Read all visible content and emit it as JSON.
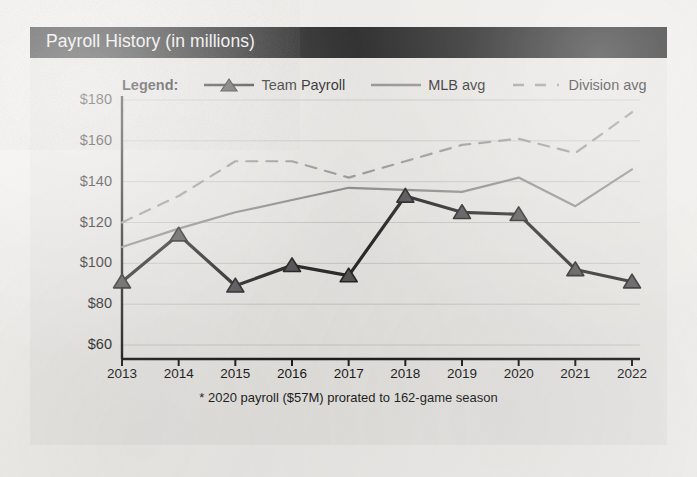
{
  "card": {
    "title": "Payroll History (in millions)",
    "title_bar_color": "#1b1b1b",
    "background_color": "#e7e5e2"
  },
  "legend": {
    "label": "Legend:",
    "entries": [
      {
        "name": "Team Payroll",
        "marker": "triangle-marker-icon",
        "style": "solid-thick",
        "color": "#2b2b2b"
      },
      {
        "name": "MLB avg",
        "marker": "line-swatch-icon",
        "style": "solid-thin",
        "color": "#8e8e8e"
      },
      {
        "name": "Division avg",
        "marker": "dashed-line-icon",
        "style": "dashed",
        "color": "#9a9a9a"
      }
    ]
  },
  "footnote": "* 2020 payroll ($57M) prorated to 162-game season",
  "chart_data": {
    "type": "line",
    "title": "Payroll History (in millions)",
    "xlabel": "",
    "ylabel": "",
    "x": [
      "2013",
      "2014",
      "2015",
      "2016",
      "2017",
      "2018",
      "2019",
      "2020",
      "2021",
      "2022"
    ],
    "categories": [
      "2013",
      "2014",
      "2015",
      "2016",
      "2017",
      "2018",
      "2019",
      "2020",
      "2021",
      "2022"
    ],
    "ylim": [
      60,
      180
    ],
    "ytick_values": [
      180,
      160,
      140,
      120,
      100,
      80,
      60
    ],
    "ytick_labels": [
      "$180",
      "$160",
      "$140",
      "$120",
      "$100",
      "$80",
      "$60"
    ],
    "grid": true,
    "legend_position": "top",
    "series": [
      {
        "name": "Team Payroll",
        "color": "#2b2b2b",
        "style": "solid",
        "marker": "triangle",
        "values": [
          91,
          114,
          89,
          99,
          94,
          133,
          125,
          124,
          97,
          91
        ]
      },
      {
        "name": "MLB avg",
        "color": "#8e8e8e",
        "style": "solid",
        "marker": "none",
        "values": [
          108,
          117,
          125,
          131,
          137,
          136,
          135,
          142,
          128,
          146
        ]
      },
      {
        "name": "Division avg",
        "color": "#9a9a9a",
        "style": "dashed",
        "marker": "none",
        "values": [
          120,
          133,
          150,
          150,
          142,
          150,
          158,
          161,
          154,
          174
        ]
      }
    ],
    "annotations": [
      "* 2020 payroll ($57M) prorated to 162-game season"
    ]
  }
}
